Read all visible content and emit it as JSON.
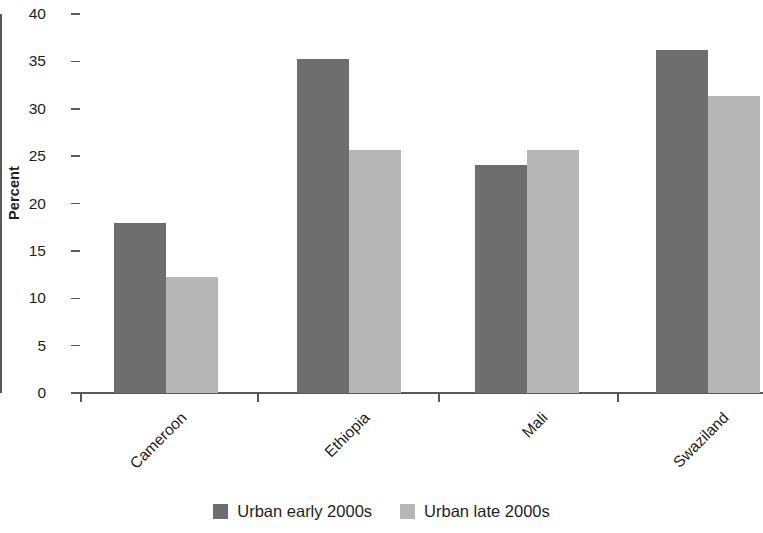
{
  "chart_data": {
    "type": "bar",
    "title": "",
    "subtitle": "",
    "xlabel": "",
    "ylabel": "Percent",
    "ylim": [
      0,
      40
    ],
    "ytick_step": 5,
    "yticks": [
      "40",
      "35",
      "30",
      "25",
      "20",
      "15",
      "10",
      "5",
      "0"
    ],
    "grid": false,
    "legend_position": "bottom-center",
    "categories": [
      "Cameroon",
      "Ethiopia",
      "Mali",
      "Swaziland"
    ],
    "series": [
      {
        "name": "Urban early 2000s",
        "color": "#6e6e6e",
        "values": [
          17.9,
          35.2,
          24.1,
          36.2
        ]
      },
      {
        "name": "Urban late 2000s",
        "color": "#b6b6b6",
        "values": [
          12.2,
          25.7,
          25.6,
          31.3
        ]
      }
    ]
  },
  "axis": {
    "y_title": "Percent"
  },
  "legend": {
    "items": [
      {
        "label": "Urban early 2000s",
        "color": "#6e6e6e"
      },
      {
        "label": "Urban late 2000s",
        "color": "#b6b6b6"
      }
    ]
  }
}
